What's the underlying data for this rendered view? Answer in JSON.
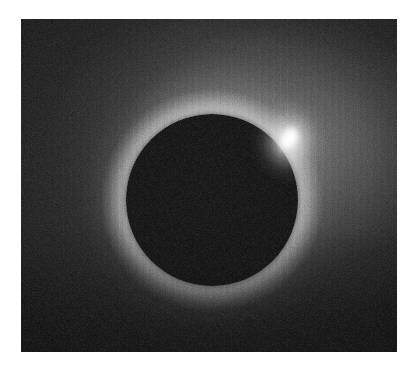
{
  "image": {
    "subject": "total-solar-eclipse",
    "description": "Black-and-white photograph of a total solar eclipse: the dark lunar disk silhouetted against the sun's glowing corona, with a brilliant diamond-ring flash at the upper-right limb.",
    "medium": "grainy monochrome film photograph",
    "canvas": {
      "width_px": 414,
      "height_px": 374,
      "background_color": "#ffffff"
    },
    "plate": {
      "name": "photograph-plate",
      "left_px": 21,
      "top_px": 19,
      "width_px": 376,
      "height_px": 333,
      "corner_color": "#0c0c0c"
    },
    "features": [
      {
        "name": "moon-disk",
        "label": "Occulting lunar disk",
        "center_x_px": 212,
        "center_y_px": 200,
        "radius_px": 86,
        "color": "#090909"
      },
      {
        "name": "corona",
        "label": "Solar corona",
        "center_x_px": 212,
        "center_y_px": 200,
        "peak_color": "#e6e6e6",
        "falloff_color": "#0d0d0d",
        "brightest_direction": "upper-right"
      },
      {
        "name": "diamond-ring-bead",
        "label": "Diamond ring / Baily's bead",
        "center_x_px": 289,
        "center_y_px": 140,
        "width_px": 24,
        "height_px": 34,
        "tilt_deg": 28,
        "core_color": "#ffffff"
      }
    ],
    "palette": {
      "paper_white": "#ffffff",
      "sky_dark": "#101010",
      "corona_mid_gray": "#6a6a6a",
      "corona_bright": "#e6e6e6",
      "disk_black": "#090909",
      "bead_white": "#ffffff"
    }
  }
}
